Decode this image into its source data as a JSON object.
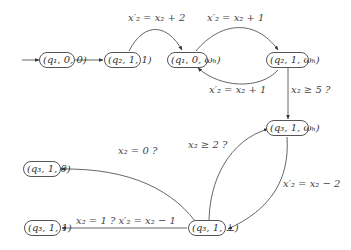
{
  "diagram": {
    "type": "automaton",
    "nodes": [
      {
        "id": "n1",
        "label": "(q₁, 0, 0)",
        "initial": true
      },
      {
        "id": "n2",
        "label": "(q₂, 1, 1)"
      },
      {
        "id": "n3",
        "label": "(q₁, 0, ωₕ)"
      },
      {
        "id": "n4",
        "label": "(q₂, 1, ωₕ)"
      },
      {
        "id": "n5",
        "label": "(q₃, 1, ωₕ)"
      },
      {
        "id": "n6",
        "label": "(q₃, 1, ⊥)"
      },
      {
        "id": "n7",
        "label": "(q₃, 1, 0)"
      },
      {
        "id": "n8",
        "label": "(q₃, 1, 1)"
      }
    ],
    "edges": [
      {
        "from": "init",
        "to": "n1",
        "label": ""
      },
      {
        "from": "n1",
        "to": "n2",
        "label": ""
      },
      {
        "from": "n2",
        "to": "n3",
        "label": "x′₂ = x₂ + 2"
      },
      {
        "from": "n3",
        "to": "n4",
        "label": "x′₂ = x₂ + 1"
      },
      {
        "from": "n4",
        "to": "n3",
        "label": "x′₂ = x₂ + 1"
      },
      {
        "from": "n4",
        "to": "n5",
        "label": "x₂ ≥ 5 ?"
      },
      {
        "from": "n6",
        "to": "n5",
        "label": "x₂ ≥ 2 ?"
      },
      {
        "from": "n5",
        "to": "n6",
        "label": "x′₂ = x₂ − 2"
      },
      {
        "from": "n6",
        "to": "n7",
        "label": "x₂ = 0 ?"
      },
      {
        "from": "n6",
        "to": "n8",
        "label": "x₂ = 1 ? x′₂ = x₂ − 1"
      }
    ]
  }
}
